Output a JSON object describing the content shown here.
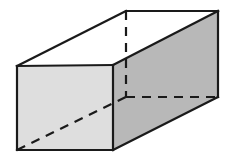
{
  "figure": {
    "shape_name": "rectangular prism (cuboid)",
    "background_color": "#ffffff",
    "stroke_color": "#1a1a1a",
    "stroke_width": 2.2,
    "dashed_stroke_width": 2.2,
    "dash_pattern": "9 7",
    "faces": {
      "top": {
        "name": "top-face",
        "fill": "#ffffff",
        "points": "17,66 126,11 218,11 113,65"
      },
      "front": {
        "name": "front-face",
        "fill": "#dedede",
        "points": "17,66 113,65 113,150 17,150"
      },
      "right": {
        "name": "right-face",
        "fill": "#b8b8b8",
        "points": "113,65 218,11 218,97 113,150"
      }
    },
    "visible_edges": [
      {
        "name": "top-front-edge",
        "x1": 17,
        "y1": 66,
        "x2": 113,
        "y2": 65
      },
      {
        "name": "top-left-edge",
        "x1": 17,
        "y1": 66,
        "x2": 126,
        "y2": 11
      },
      {
        "name": "top-back-edge",
        "x1": 126,
        "y1": 11,
        "x2": 218,
        "y2": 11
      },
      {
        "name": "top-right-edge",
        "x1": 218,
        "y1": 11,
        "x2": 113,
        "y2": 65
      },
      {
        "name": "front-left-edge",
        "x1": 17,
        "y1": 66,
        "x2": 17,
        "y2": 150
      },
      {
        "name": "front-bottom-edge",
        "x1": 17,
        "y1": 150,
        "x2": 113,
        "y2": 150
      },
      {
        "name": "front-right-edge",
        "x1": 113,
        "y1": 65,
        "x2": 113,
        "y2": 150
      },
      {
        "name": "right-back-vertical-edge",
        "x1": 218,
        "y1": 11,
        "x2": 218,
        "y2": 97
      },
      {
        "name": "right-bottom-edge",
        "x1": 113,
        "y1": 150,
        "x2": 218,
        "y2": 97
      }
    ],
    "hidden_edges": [
      {
        "name": "hidden-vertical-edge",
        "x1": 126,
        "y1": 11,
        "x2": 126,
        "y2": 97
      },
      {
        "name": "hidden-back-bottom-edge",
        "x1": 126,
        "y1": 97,
        "x2": 218,
        "y2": 97
      },
      {
        "name": "hidden-diagonal-edge",
        "x1": 17,
        "y1": 150,
        "x2": 126,
        "y2": 97
      }
    ],
    "vertices": [
      {
        "name": "front-top-left",
        "x": 17,
        "y": 66
      },
      {
        "name": "front-top-right",
        "x": 113,
        "y": 65
      },
      {
        "name": "front-bottom-left",
        "x": 17,
        "y": 150
      },
      {
        "name": "front-bottom-right",
        "x": 113,
        "y": 150
      },
      {
        "name": "back-top-left",
        "x": 126,
        "y": 11
      },
      {
        "name": "back-top-right",
        "x": 218,
        "y": 11
      },
      {
        "name": "back-bottom-left",
        "x": 126,
        "y": 97
      },
      {
        "name": "back-bottom-right",
        "x": 218,
        "y": 97
      }
    ]
  }
}
